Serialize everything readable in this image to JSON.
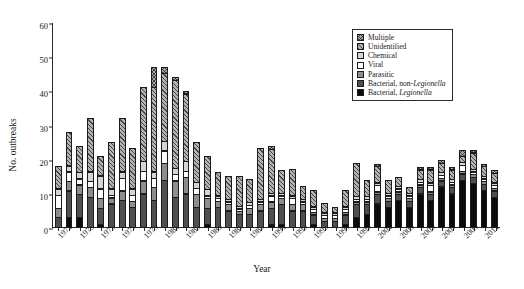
{
  "chart_data": {
    "type": "bar",
    "subtype": "stacked",
    "title": "",
    "xlabel": "Year",
    "ylabel": "No. outbreaks",
    "ylim": [
      0,
      60
    ],
    "yticks": [
      0,
      10,
      20,
      30,
      40,
      50,
      60
    ],
    "grid": false,
    "legend_position": "top-right",
    "categories": [
      "1971",
      "1972",
      "1973",
      "1974",
      "1975",
      "1976",
      "1977",
      "1978",
      "1979",
      "1980",
      "1981",
      "1982",
      "1983",
      "1984",
      "1985",
      "1986",
      "1987",
      "1988",
      "1989",
      "1990",
      "1991",
      "1992",
      "1993",
      "1994",
      "1995",
      "1996",
      "1997",
      "1998",
      "1999",
      "2000",
      "2001",
      "2002",
      "2003",
      "2004",
      "2005",
      "2006",
      "2007",
      "2008",
      "2009",
      "2010",
      "2011",
      "2012"
    ],
    "tick_labels": [
      "1971",
      "1973",
      "1975",
      "1977",
      "1979",
      "1981",
      "1983",
      "1985",
      "1987",
      "1989",
      "1991",
      "1993",
      "1995",
      "1997",
      "1999",
      "2001",
      "2003",
      "2005",
      "2007",
      "2009",
      "2011"
    ],
    "series": [
      {
        "name": "Bacterial, Legionella",
        "key": "legionella",
        "color": "#0b0b0b",
        "pattern": "solid-black",
        "values": [
          0,
          3,
          3,
          0,
          1,
          0,
          0,
          0,
          0,
          0,
          0,
          0,
          0,
          0,
          1,
          0,
          0,
          0,
          0,
          0,
          1,
          1,
          0,
          0,
          1,
          0,
          0,
          1,
          3,
          4,
          7,
          6,
          8,
          6,
          10,
          8,
          12,
          10,
          14,
          13,
          11,
          9
        ]
      },
      {
        "name": "Bacterial, non-Legionella",
        "key": "bactnon",
        "color": "#4f4f4f",
        "pattern": "solid-dark-gray",
        "values": [
          3,
          8,
          7,
          9,
          5,
          7,
          8,
          6,
          10,
          8,
          14,
          9,
          10,
          6,
          5,
          6,
          5,
          4,
          4,
          5,
          5,
          6,
          5,
          5,
          3,
          2,
          2,
          3,
          4,
          3,
          3,
          2,
          2,
          2,
          2,
          2,
          2,
          2,
          2,
          2,
          2,
          2
        ]
      },
      {
        "name": "Parasitic",
        "key": "parasitic",
        "color": "#8e8e8e",
        "pattern": "solid-mid-gray",
        "values": [
          3,
          3,
          3,
          3,
          3,
          2,
          3,
          2,
          4,
          4,
          5,
          5,
          5,
          4,
          3,
          2,
          2,
          1,
          2,
          2,
          2,
          2,
          2,
          2,
          1,
          1,
          1,
          1,
          1,
          1,
          1,
          1,
          1,
          1,
          1,
          1,
          1,
          1,
          1,
          1,
          1,
          1
        ]
      },
      {
        "name": "Viral",
        "key": "viral",
        "color": "#ffffff",
        "pattern": "white",
        "values": [
          4,
          3,
          2,
          2,
          3,
          1,
          4,
          2,
          3,
          3,
          4,
          2,
          2,
          2,
          1,
          1,
          1,
          1,
          1,
          1,
          2,
          1,
          2,
          1,
          1,
          1,
          1,
          1,
          1,
          1,
          2,
          1,
          1,
          1,
          1,
          2,
          1,
          1,
          2,
          1,
          1,
          1
        ]
      },
      {
        "name": "Chemical",
        "key": "chemical",
        "color": "#d5d5d5",
        "pattern": "light-gray",
        "values": [
          2,
          2,
          2,
          3,
          4,
          2,
          2,
          2,
          3,
          2,
          3,
          2,
          3,
          2,
          2,
          1,
          1,
          1,
          1,
          1,
          1,
          1,
          1,
          1,
          1,
          1,
          1,
          1,
          1,
          1,
          1,
          1,
          1,
          1,
          1,
          1,
          1,
          1,
          1,
          1,
          1,
          1
        ]
      },
      {
        "name": "Unidentified",
        "key": "unident",
        "color": "#b3b3b3",
        "pattern": "diagonal-hatch",
        "values": [
          7,
          10,
          8,
          16,
          6,
          14,
          16,
          12,
          22,
          25,
          20,
          26,
          20,
          12,
          10,
          7,
          7,
          9,
          7,
          15,
          13,
          7,
          8,
          4,
          5,
          3,
          2,
          5,
          10,
          5,
          5,
          4,
          3,
          2,
          3,
          4,
          3,
          3,
          2,
          5,
          3,
          3
        ]
      },
      {
        "name": "Multiple",
        "key": "multiple",
        "color": "#a8a8a8",
        "pattern": "cross-hatch",
        "values": [
          0,
          0,
          0,
          0,
          0,
          0,
          0,
          0,
          0,
          6,
          2,
          1,
          1,
          0,
          0,
          0,
          0,
          0,
          0,
          0,
          1,
          0,
          0,
          0,
          0,
          0,
          0,
          0,
          0,
          0,
          1,
          0,
          0,
          0,
          1,
          1,
          1,
          1,
          2,
          1,
          1,
          1
        ]
      }
    ],
    "totals": [
      19,
      29,
      25,
      33,
      22,
      26,
      33,
      24,
      42,
      48,
      48,
      45,
      41,
      26,
      22,
      19,
      18,
      17,
      18,
      24,
      25,
      18,
      18,
      13,
      12,
      8,
      7,
      12,
      20,
      15,
      20,
      15,
      16,
      13,
      19,
      19,
      21,
      19,
      24,
      24,
      20,
      17
    ]
  },
  "legend": {
    "items": [
      {
        "label": "Multiple",
        "emphasis": ""
      },
      {
        "label": "Unidentified",
        "emphasis": ""
      },
      {
        "label": "Chemical",
        "emphasis": ""
      },
      {
        "label": "Viral",
        "emphasis": ""
      },
      {
        "label": "Parasitic",
        "emphasis": ""
      },
      {
        "label": "Bacterial, non-",
        "emphasis": "Legionella"
      },
      {
        "label": "Bacterial, ",
        "emphasis": "Legionella"
      }
    ]
  }
}
